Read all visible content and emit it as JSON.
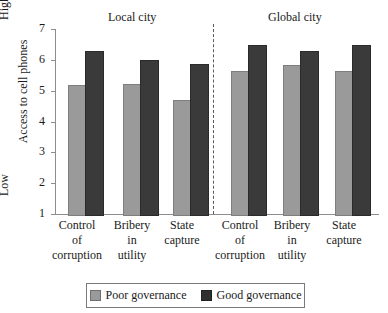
{
  "chart_data": {
    "type": "bar",
    "title": "",
    "xlabel": "",
    "ylabel": "Access to cell phones",
    "ylim": [
      1,
      7
    ],
    "yticks": [
      1,
      2,
      3,
      4,
      5,
      6,
      7
    ],
    "ytick_labels": [
      "1",
      "2",
      "3",
      "4",
      "5",
      "6",
      "7"
    ],
    "y_axis_low_label": "Low",
    "y_axis_high_label": "High",
    "grid": false,
    "legend_position": "bottom",
    "panels": [
      {
        "label": "Local city"
      },
      {
        "label": "Global city"
      }
    ],
    "categories": [
      "Control of corruption",
      "Bribery in utility",
      "State capture",
      "Control of corruption",
      "Bribery in utility",
      "State capture"
    ],
    "category_lines": [
      [
        "Control",
        "of",
        "corruption"
      ],
      [
        "Bribery",
        "in",
        "utility"
      ],
      [
        "State",
        "capture"
      ],
      [
        "Control",
        "of",
        "corruption"
      ],
      [
        "Bribery",
        "in",
        "utility"
      ],
      [
        "State",
        "capture"
      ]
    ],
    "series": [
      {
        "name": "Poor governance",
        "color": "#9a9a9a",
        "values": [
          5.2,
          5.23,
          4.7,
          5.65,
          5.82,
          5.65
        ]
      },
      {
        "name": "Good governance",
        "color": "#3a3a3a",
        "values": [
          6.3,
          5.98,
          5.87,
          6.48,
          6.28,
          6.48
        ]
      }
    ]
  },
  "legend": {
    "items": [
      {
        "label": "Poor governance"
      },
      {
        "label": "Good governance"
      }
    ]
  }
}
